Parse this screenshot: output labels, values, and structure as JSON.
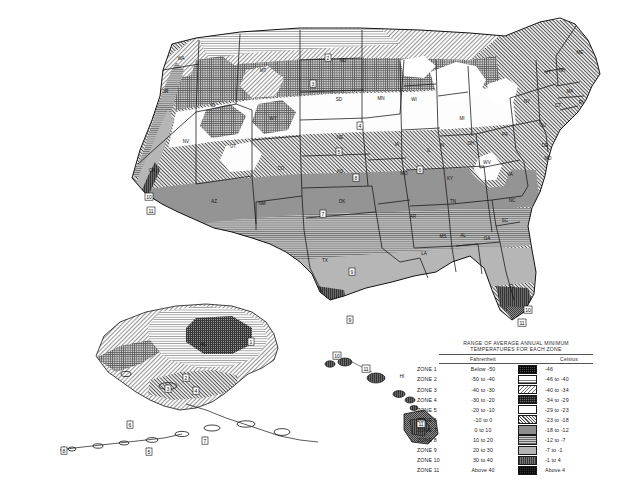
{
  "map": {
    "title": "USDA Plant Hardiness Zone Map",
    "legend": {
      "title_line1": "RANGE OF AVERAGE ANNUAL MINIMUM",
      "title_line2": "TEMPERATURES FOR EACH ZONE",
      "col_fahrenheit": "Fahrenheit",
      "col_celsius": "Celsius",
      "rows": [
        {
          "zone": "ZONE 1",
          "fahrenheit": "Below -50",
          "celsius": "-46",
          "swatch": "zone-1-swatch"
        },
        {
          "zone": "ZONE 2",
          "fahrenheit": "-50 to -40",
          "celsius": "-46 to -40",
          "swatch": "zone-2-swatch"
        },
        {
          "zone": "ZONE 3",
          "fahrenheit": "-40 to -30",
          "celsius": "-40 to -34",
          "swatch": "zone-3-swatch"
        },
        {
          "zone": "ZONE 4",
          "fahrenheit": "-30 to -20",
          "celsius": "-34 to -29",
          "swatch": "zone-4-swatch"
        },
        {
          "zone": "ZONE 5",
          "fahrenheit": "-20 to -10",
          "celsius": "-29 to -23",
          "swatch": "zone-5-swatch"
        },
        {
          "zone": "ZONE 6",
          "fahrenheit": "-10 to 0",
          "celsius": "-23 to -18",
          "swatch": "zone-6-swatch"
        },
        {
          "zone": "ZONE 7",
          "fahrenheit": "0 to 10",
          "celsius": "-18 to -12",
          "swatch": "zone-7-swatch"
        },
        {
          "zone": "ZONE 8",
          "fahrenheit": "10 to 20",
          "celsius": "-12 to -7",
          "swatch": "zone-8-swatch"
        },
        {
          "zone": "ZONE 9",
          "fahrenheit": "20 to 30",
          "celsius": "-7 to -1",
          "swatch": "zone-9-swatch"
        },
        {
          "zone": "ZONE 10",
          "fahrenheit": "30 to 40",
          "celsius": "-1 to  4",
          "swatch": "zone-10-swatch"
        },
        {
          "zone": "ZONE 11",
          "fahrenheit": "Above 40",
          "celsius": "Above 4",
          "swatch": "zone-11-swatch"
        }
      ]
    },
    "state_labels": [
      {
        "abbr": "WA",
        "x": 181,
        "y": 60
      },
      {
        "abbr": "OR",
        "x": 165,
        "y": 93
      },
      {
        "abbr": "ID",
        "x": 213,
        "y": 107
      },
      {
        "abbr": "MT",
        "x": 263,
        "y": 72
      },
      {
        "abbr": "WY",
        "x": 273,
        "y": 120
      },
      {
        "abbr": "NV",
        "x": 186,
        "y": 143
      },
      {
        "abbr": "UT",
        "x": 233,
        "y": 148
      },
      {
        "abbr": "CA",
        "x": 152,
        "y": 172
      },
      {
        "abbr": "AZ",
        "x": 214,
        "y": 203
      },
      {
        "abbr": "NM",
        "x": 262,
        "y": 205
      },
      {
        "abbr": "CO",
        "x": 281,
        "y": 170
      },
      {
        "abbr": "ND",
        "x": 343,
        "y": 62
      },
      {
        "abbr": "SD",
        "x": 339,
        "y": 101
      },
      {
        "abbr": "NE",
        "x": 340,
        "y": 139
      },
      {
        "abbr": "KS",
        "x": 340,
        "y": 173
      },
      {
        "abbr": "OK",
        "x": 342,
        "y": 203
      },
      {
        "abbr": "TX",
        "x": 325,
        "y": 262
      },
      {
        "abbr": "MN",
        "x": 381,
        "y": 100
      },
      {
        "abbr": "IA",
        "x": 397,
        "y": 146
      },
      {
        "abbr": "MO",
        "x": 404,
        "y": 175
      },
      {
        "abbr": "AR",
        "x": 413,
        "y": 218
      },
      {
        "abbr": "LA",
        "x": 424,
        "y": 255
      },
      {
        "abbr": "WI",
        "x": 414,
        "y": 101
      },
      {
        "abbr": "IL",
        "x": 429,
        "y": 152
      },
      {
        "abbr": "MS",
        "x": 443,
        "y": 238
      },
      {
        "abbr": "AL",
        "x": 463,
        "y": 237
      },
      {
        "abbr": "TN",
        "x": 453,
        "y": 203
      },
      {
        "abbr": "KY",
        "x": 450,
        "y": 180
      },
      {
        "abbr": "IN",
        "x": 442,
        "y": 147
      },
      {
        "abbr": "MI",
        "x": 462,
        "y": 120
      },
      {
        "abbr": "OH",
        "x": 471,
        "y": 145
      },
      {
        "abbr": "GA",
        "x": 487,
        "y": 240
      },
      {
        "abbr": "FL",
        "x": 512,
        "y": 288
      },
      {
        "abbr": "SC",
        "x": 505,
        "y": 222
      },
      {
        "abbr": "NC",
        "x": 512,
        "y": 202
      },
      {
        "abbr": "VA",
        "x": 510,
        "y": 176
      },
      {
        "abbr": "WV",
        "x": 487,
        "y": 164
      },
      {
        "abbr": "PA",
        "x": 505,
        "y": 136
      },
      {
        "abbr": "NY",
        "x": 527,
        "y": 103
      },
      {
        "abbr": "ME",
        "x": 580,
        "y": 54
      },
      {
        "abbr": "NH",
        "x": 562,
        "y": 72
      },
      {
        "abbr": "VT",
        "x": 548,
        "y": 74
      },
      {
        "abbr": "MA",
        "x": 570,
        "y": 93
      },
      {
        "abbr": "CT",
        "x": 558,
        "y": 107
      },
      {
        "abbr": "RI",
        "x": 581,
        "y": 104
      },
      {
        "abbr": "NJ",
        "x": 543,
        "y": 127
      },
      {
        "abbr": "DE",
        "x": 545,
        "y": 147
      },
      {
        "abbr": "MD",
        "x": 548,
        "y": 160
      },
      {
        "abbr": "AK",
        "x": 203,
        "y": 346
      },
      {
        "abbr": "HI",
        "x": 402,
        "y": 378
      }
    ],
    "zone_markers": [
      {
        "zone": "1",
        "x": 251,
        "y": 342
      },
      {
        "zone": "2",
        "x": 186,
        "y": 378
      },
      {
        "zone": "3",
        "x": 168,
        "y": 389
      },
      {
        "zone": "4",
        "x": 196,
        "y": 391
      },
      {
        "zone": "5",
        "x": 149,
        "y": 452
      },
      {
        "zone": "6",
        "x": 130,
        "y": 425
      },
      {
        "zone": "7",
        "x": 205,
        "y": 441
      },
      {
        "zone": "8",
        "x": 64,
        "y": 451
      },
      {
        "zone": "10",
        "x": 337,
        "y": 356
      },
      {
        "zone": "11",
        "x": 366,
        "y": 369
      },
      {
        "zone": "11",
        "x": 421,
        "y": 424
      },
      {
        "zone": "10",
        "x": 149,
        "y": 197
      },
      {
        "zone": "11",
        "x": 151,
        "y": 211
      },
      {
        "zone": "7",
        "x": 323,
        "y": 214
      },
      {
        "zone": "8",
        "x": 356,
        "y": 178
      },
      {
        "zone": "9",
        "x": 352,
        "y": 272
      },
      {
        "zone": "9",
        "x": 350,
        "y": 320
      },
      {
        "zone": "10",
        "x": 528,
        "y": 310
      },
      {
        "zone": "11",
        "x": 522,
        "y": 323
      },
      {
        "zone": "4",
        "x": 360,
        "y": 126
      },
      {
        "zone": "5",
        "x": 339,
        "y": 152
      },
      {
        "zone": "6",
        "x": 420,
        "y": 170
      },
      {
        "zone": "3",
        "x": 313,
        "y": 84
      },
      {
        "zone": "2",
        "x": 328,
        "y": 58
      }
    ]
  }
}
